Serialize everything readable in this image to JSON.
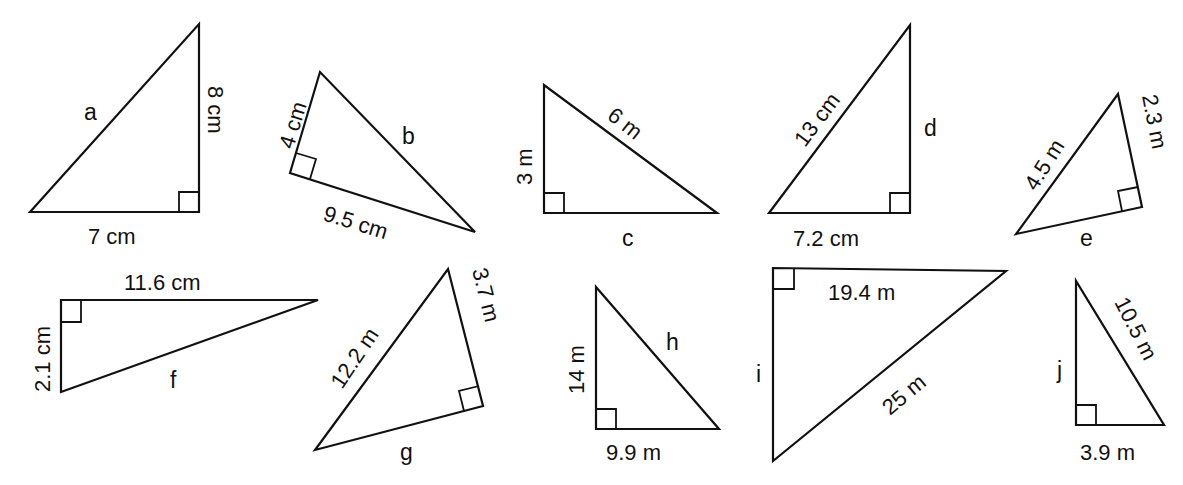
{
  "figure": {
    "triangles": [
      {
        "id": "a",
        "unknown": "a",
        "labels": {
          "leg1": "8 cm",
          "leg2": "7 cm",
          "unknown": "a"
        }
      },
      {
        "id": "b",
        "unknown": "b",
        "labels": {
          "leg1": "4 cm",
          "leg2": "9.5 cm",
          "unknown": "b"
        }
      },
      {
        "id": "c",
        "unknown": "c",
        "labels": {
          "leg1": "3 m",
          "hyp": "6 m",
          "unknown": "c"
        }
      },
      {
        "id": "d",
        "unknown": "d",
        "labels": {
          "hyp": "13 cm",
          "leg1": "7.2 cm",
          "unknown": "d"
        }
      },
      {
        "id": "e",
        "unknown": "e",
        "labels": {
          "hyp": "4.5 m",
          "leg1": "2.3 m",
          "unknown": "e"
        }
      },
      {
        "id": "f",
        "unknown": "f",
        "labels": {
          "leg1": "11.6 cm",
          "leg2": "2.1 cm",
          "unknown": "f"
        }
      },
      {
        "id": "g",
        "unknown": "g",
        "labels": {
          "hyp": "12.2 m",
          "leg1": "3.7 m",
          "unknown": "g"
        }
      },
      {
        "id": "h",
        "unknown": "h",
        "labels": {
          "leg1": "14 m",
          "leg2": "9.9 m",
          "unknown": "h"
        }
      },
      {
        "id": "i",
        "unknown": "i",
        "labels": {
          "leg1": "19.4 m",
          "hyp": "25 m",
          "unknown": "i"
        }
      },
      {
        "id": "j",
        "unknown": "j",
        "labels": {
          "hyp": "10.5 m",
          "leg1": "3.9 m",
          "unknown": "j"
        }
      }
    ]
  }
}
